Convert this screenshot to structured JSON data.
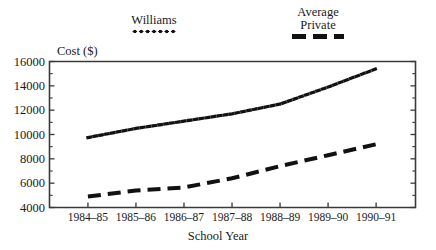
{
  "chart_data": {
    "type": "line",
    "title": "",
    "xlabel": "School Year",
    "ylabel": "Cost ($)",
    "categories": [
      "1984–85",
      "1985–86",
      "1986–87",
      "1987–88",
      "1988–89",
      "1989–90",
      "1990–91"
    ],
    "ylim": [
      4000,
      16000
    ],
    "yticks": [
      4000,
      6000,
      8000,
      10000,
      12000,
      14000,
      16000
    ],
    "ytick_labels": [
      "4000",
      "6000",
      "8000",
      "10000",
      "12000",
      "14000",
      "16000"
    ],
    "grid": false,
    "legend_position": "above-plot",
    "series": [
      {
        "name": "Williams",
        "style": "dotted",
        "color": "#111111",
        "values": [
          9750,
          10500,
          11100,
          11700,
          12500,
          13900,
          15400
        ]
      },
      {
        "name": "Average\nPrivate",
        "style": "dashed",
        "color": "#111111",
        "values": [
          4900,
          5400,
          5650,
          6400,
          7400,
          8300,
          9200
        ]
      }
    ]
  },
  "legend": {
    "williams": {
      "label": "Williams",
      "swatch": "dotted-line-swatch"
    },
    "average_private": {
      "label": "Average\nPrivate",
      "swatch": "dashed-line-swatch"
    }
  },
  "axes": {
    "y_title": "Cost ($)",
    "x_title": "School Year"
  },
  "colors": {
    "ink": "#111111",
    "axis": "#3a3a3a",
    "background": "#ffffff"
  }
}
